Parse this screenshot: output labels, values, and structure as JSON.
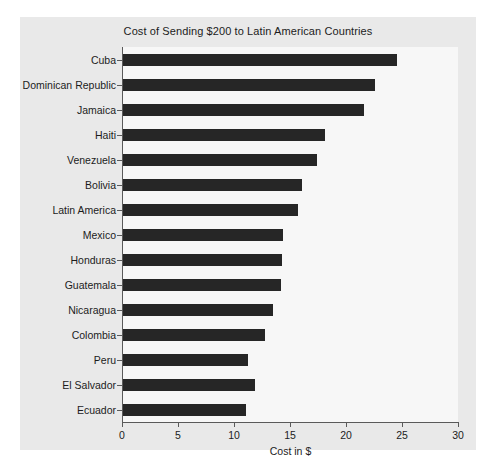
{
  "chart_data": {
    "type": "bar",
    "orientation": "horizontal",
    "title": "Cost of Sending $200 to Latin American Countries",
    "xlabel": "Cost in $",
    "ylabel": "",
    "xlim": [
      0,
      30
    ],
    "xticks": [
      0,
      5,
      10,
      15,
      20,
      25,
      30
    ],
    "xtick_labels": [
      "0",
      "5",
      "10",
      "15",
      "20",
      "25",
      "30"
    ],
    "grid": false,
    "legend": null,
    "bar_color": "#262626",
    "plot_background": "#f7f7f7",
    "figure_background": "#e9e9e9",
    "categories": [
      "Cuba",
      "Dominican Republic",
      "Jamaica",
      "Haiti",
      "Venezuela",
      "Bolivia",
      "Latin America",
      "Mexico",
      "Honduras",
      "Guatemala",
      "Nicaragua",
      "Colombia",
      "Peru",
      "El Salvador",
      "Ecuador"
    ],
    "values": [
      24.5,
      22.5,
      21.5,
      18.0,
      17.3,
      16.0,
      15.6,
      14.3,
      14.2,
      14.1,
      13.4,
      12.7,
      11.2,
      11.8,
      11.0
    ]
  }
}
